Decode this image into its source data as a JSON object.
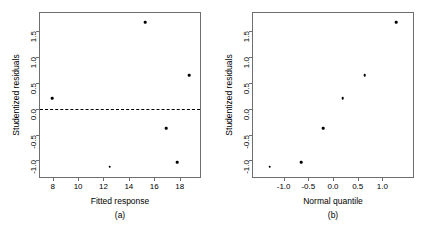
{
  "figure": {
    "background": "#ffffff",
    "point_color": "#000000",
    "axis_color": "#6e6e6e"
  },
  "chart_data": [
    {
      "type": "scatter",
      "panel": "a",
      "caption": "(a)",
      "title": "",
      "xlabel": "Fitted response",
      "ylabel": "Studentized residuals",
      "xlim": [
        7.0,
        19.6
      ],
      "ylim": [
        -1.32,
        1.85
      ],
      "xticks": [
        8,
        10,
        12,
        14,
        16,
        18
      ],
      "xticklabels": [
        "8",
        "10",
        "12",
        "14",
        "16",
        "18"
      ],
      "yticks": [
        -1.0,
        -0.5,
        0.0,
        0.5,
        1.0,
        1.5
      ],
      "yticklabels": [
        "-1.0",
        "-0.5",
        "0.0",
        "0.5",
        "1.0",
        "1.5"
      ],
      "grid": false,
      "legend": false,
      "reference_line": {
        "type": "horizontal",
        "y": 0.0,
        "style": "dashed"
      },
      "x": [
        7.95,
        12.5,
        15.3,
        16.95,
        17.8,
        18.75
      ],
      "y": [
        0.2,
        -1.12,
        1.67,
        -0.38,
        -1.03,
        0.65
      ],
      "n_points": 6
    },
    {
      "type": "scatter",
      "panel": "b",
      "caption": "(b)",
      "title": "",
      "xlabel": "Normal quantile",
      "ylabel": "Studentized residuals",
      "xlim": [
        -1.62,
        1.62
      ],
      "ylim": [
        -1.32,
        1.85
      ],
      "xticks": [
        -1.0,
        -0.5,
        0.0,
        0.5,
        1.0
      ],
      "xticklabels": [
        "-1.0",
        "-0.5",
        "0.0",
        "0.5",
        "1.0"
      ],
      "yticks": [
        -1.0,
        -0.5,
        0.0,
        0.5,
        1.0,
        1.5
      ],
      "yticklabels": [
        "-1.0",
        "-0.5",
        "0.0",
        "0.5",
        "1.0",
        "1.5"
      ],
      "grid": false,
      "legend": false,
      "x": [
        -1.28,
        -0.64,
        -0.2,
        0.2,
        0.64,
        1.28
      ],
      "y": [
        -1.12,
        -1.03,
        -0.38,
        0.2,
        0.65,
        1.67
      ],
      "n_points": 6
    }
  ]
}
